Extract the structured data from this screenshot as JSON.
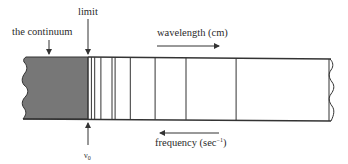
{
  "diagram": {
    "type": "spectrum-series-limit",
    "labels": {
      "continuum": "the continuum",
      "limit": "limit",
      "wavelength": "wavelength (cm)",
      "frequency_prefix": "frequency (sec",
      "frequency_exp": "−1",
      "frequency_suffix": ")",
      "nu_symbol": "ν",
      "nu_subscript": "0"
    },
    "arrows": {
      "wavelength_direction": "right",
      "frequency_direction": "left"
    },
    "spectral_lines_relative": [
      0.0,
      0.013,
      0.026,
      0.05,
      0.093,
      0.105,
      0.164,
      0.26,
      0.38,
      0.574,
      0.934
    ],
    "colors": {
      "continuum_fill": "#777777",
      "line_color": "#333333",
      "background": "#ffffff"
    }
  }
}
